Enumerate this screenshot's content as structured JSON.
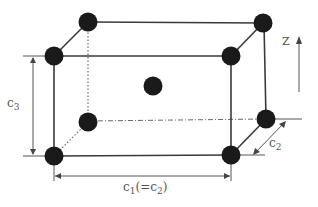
{
  "diagram": {
    "type": "body-centered tetragonal unit cell",
    "labels": {
      "c3": {
        "base": "c",
        "sub": "3"
      },
      "c2": {
        "base": "c",
        "sub": "2"
      },
      "c1": {
        "base": "c",
        "sub1": "1",
        "mid": "(=c",
        "sub2": "2",
        "end": ")"
      },
      "axis": "Z"
    },
    "atoms": [
      {
        "name": "back-top-left",
        "x": 88,
        "y": 22
      },
      {
        "name": "back-top-right",
        "x": 263,
        "y": 23
      },
      {
        "name": "front-top-left",
        "x": 54,
        "y": 56
      },
      {
        "name": "front-top-right",
        "x": 231,
        "y": 56
      },
      {
        "name": "body-center",
        "x": 153,
        "y": 86
      },
      {
        "name": "back-bottom-left",
        "x": 88,
        "y": 122
      },
      {
        "name": "back-bottom-right",
        "x": 266,
        "y": 119
      },
      {
        "name": "front-bottom-left",
        "x": 54,
        "y": 156
      },
      {
        "name": "front-bottom-right",
        "x": 231,
        "y": 155
      }
    ],
    "colors": {
      "atom": "#1a1a1a",
      "line": "#3a3a3a",
      "text": "#555555"
    }
  }
}
